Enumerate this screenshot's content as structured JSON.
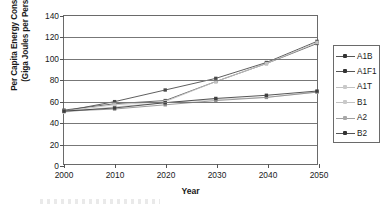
{
  "chart_data": {
    "type": "line",
    "title": "",
    "xlabel": "Year",
    "ylabel": "Per Capita Energy Consumed\n(Giga Joules per Person)",
    "x": [
      2000,
      2010,
      2020,
      2030,
      2040,
      2050
    ],
    "categories": [
      "2000",
      "2010",
      "2020",
      "2030",
      "2040",
      "2050"
    ],
    "xlim": [
      2000,
      2050
    ],
    "ylim": [
      0,
      140
    ],
    "ytick_values": [
      0,
      20,
      40,
      60,
      80,
      100,
      120,
      140
    ],
    "ytick_labels": [
      "0",
      "20",
      "40",
      "60",
      "80",
      "100",
      "120",
      "140"
    ],
    "grid": "horizontal",
    "legend_position": "right-outside",
    "series": [
      {
        "name": "A1B",
        "values": [
          50,
          59,
          70,
          81,
          96,
          116
        ],
        "color": "#4a4a4a"
      },
      {
        "name": "A1F1",
        "values": [
          51,
          57,
          60,
          78,
          95,
          114
        ],
        "color": "#5a5a5a"
      },
      {
        "name": "A1T",
        "values": [
          50,
          56,
          59,
          78,
          95,
          115
        ],
        "color": "#c2c2c2"
      },
      {
        "name": "B1",
        "values": [
          49,
          54,
          58,
          61,
          63,
          68
        ],
        "color": "#c9c9c9"
      },
      {
        "name": "A2",
        "values": [
          50,
          52,
          56,
          60,
          63,
          68
        ],
        "color": "#8f8f8f"
      },
      {
        "name": "B2",
        "values": [
          50,
          53,
          58,
          62,
          65,
          69
        ],
        "color": "#3f3f3f"
      }
    ]
  },
  "legend": {
    "items": [
      {
        "label": "A1B",
        "style": "solid"
      },
      {
        "label": "A1F1",
        "style": "solid"
      },
      {
        "label": "A1T",
        "style": "faint"
      },
      {
        "label": "B1",
        "style": "faint"
      },
      {
        "label": "A2",
        "style": "semi"
      },
      {
        "label": "B2",
        "style": "solid"
      }
    ]
  },
  "axes": {
    "y_title": "Per Capita Energy Consumed\n(Giga Joules per Person)",
    "x_title": "Year"
  }
}
